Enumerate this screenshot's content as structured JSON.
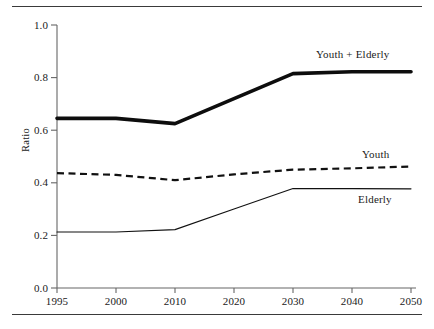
{
  "figure": {
    "rules": {
      "top": "horizontal-rule",
      "bottom": "horizontal-rule"
    }
  },
  "axis": {
    "ylabel": "Ratio",
    "yticks": [
      "0.0",
      "0.2",
      "0.4",
      "0.6",
      "0.8",
      "1.0"
    ],
    "xticks": [
      "1995",
      "2000",
      "2010",
      "2020",
      "2030",
      "2040",
      "2050"
    ]
  },
  "labels": {
    "youth_elderly": "Youth + Elderly",
    "youth": "Youth",
    "elderly": "Elderly"
  },
  "colors": {
    "ink": "#111111",
    "rule": "#3a3a3a",
    "axis": "#555555",
    "background": "#ffffff"
  },
  "chart_data": {
    "type": "line",
    "title": "",
    "xlabel": "",
    "ylabel": "Ratio",
    "xlim": [
      1995,
      2050
    ],
    "ylim": [
      0.0,
      1.0
    ],
    "grid": false,
    "legend": "inline-labels",
    "x": [
      1995,
      2000,
      2010,
      2020,
      2030,
      2040,
      2050
    ],
    "xtick_labels": [
      "1995",
      "2000",
      "2010",
      "2020",
      "2030",
      "2040",
      "2050"
    ],
    "ytick_labels": [
      "0.0",
      "0.2",
      "0.4",
      "0.6",
      "0.8",
      "1.0"
    ],
    "series": [
      {
        "name": "Youth + Elderly",
        "style": "thick-solid",
        "values": [
          0.645,
          0.645,
          0.625,
          0.72,
          0.815,
          0.822,
          0.822
        ]
      },
      {
        "name": "Youth",
        "style": "dashed",
        "values": [
          0.437,
          0.43,
          0.41,
          0.432,
          0.45,
          0.455,
          0.462
        ]
      },
      {
        "name": "Elderly",
        "style": "thin-solid",
        "values": [
          0.213,
          0.213,
          0.222,
          0.3,
          0.378,
          0.378,
          0.377
        ]
      }
    ]
  }
}
